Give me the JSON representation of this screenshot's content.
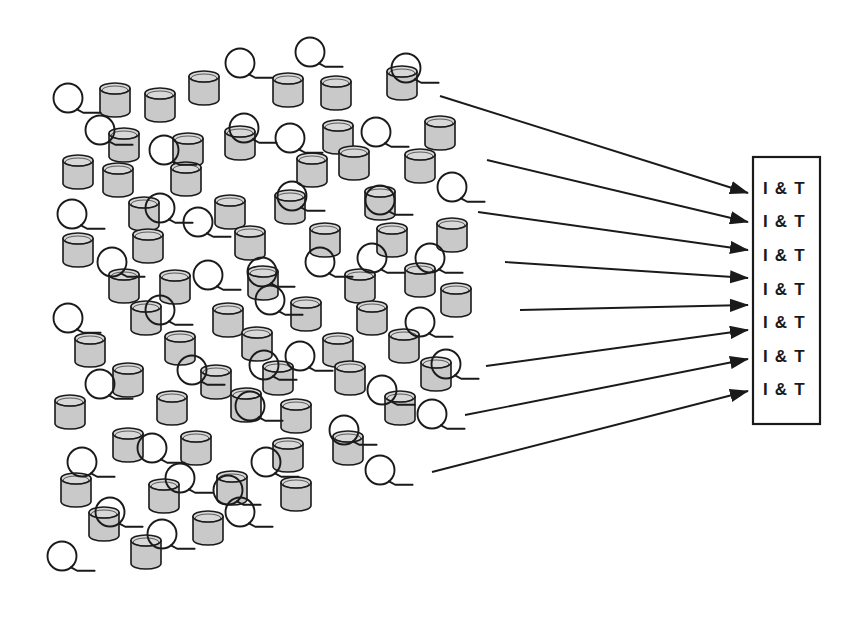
{
  "diagram": {
    "background_color": "#ffffff",
    "stroke_color": "#1a1a1a",
    "cylinder_fill": "#c9c9c9",
    "cylinder_top_fill": "#d8d8d8",
    "loop_icon_name": "coil-loop-symbol",
    "cylinder_icon_name": "cylinder-symbol"
  },
  "target_box": {
    "name": "integration-and-test-box",
    "x": 753,
    "y": 157,
    "width": 67,
    "height": 267,
    "border_color": "#1a1a1a",
    "fill": "#ffffff",
    "rows": [
      {
        "label": "I & T"
      },
      {
        "label": "I & T"
      },
      {
        "label": "I & T"
      },
      {
        "label": "I & T"
      },
      {
        "label": "I & T"
      },
      {
        "label": "I & T"
      },
      {
        "label": "I & T"
      }
    ]
  },
  "arrows": [
    {
      "name": "arrow-1",
      "x1": 440,
      "y1": 96,
      "x2": 748,
      "y2": 193
    },
    {
      "name": "arrow-2",
      "x1": 487,
      "y1": 160,
      "x2": 748,
      "y2": 222
    },
    {
      "name": "arrow-3",
      "x1": 478,
      "y1": 212,
      "x2": 748,
      "y2": 250
    },
    {
      "name": "arrow-4",
      "x1": 505,
      "y1": 262,
      "x2": 748,
      "y2": 278
    },
    {
      "name": "arrow-5",
      "x1": 520,
      "y1": 310,
      "x2": 748,
      "y2": 305
    },
    {
      "name": "arrow-6",
      "x1": 486,
      "y1": 366,
      "x2": 748,
      "y2": 330
    },
    {
      "name": "arrow-7",
      "x1": 465,
      "y1": 415,
      "x2": 748,
      "y2": 359
    },
    {
      "name": "arrow-8",
      "x1": 432,
      "y1": 472,
      "x2": 748,
      "y2": 391
    }
  ],
  "cylinders": [
    {
      "x": 115,
      "y": 100
    },
    {
      "x": 160,
      "y": 105
    },
    {
      "x": 204,
      "y": 88
    },
    {
      "x": 288,
      "y": 90
    },
    {
      "x": 336,
      "y": 93
    },
    {
      "x": 402,
      "y": 83
    },
    {
      "x": 124,
      "y": 145
    },
    {
      "x": 188,
      "y": 150
    },
    {
      "x": 240,
      "y": 143
    },
    {
      "x": 338,
      "y": 137
    },
    {
      "x": 440,
      "y": 133
    },
    {
      "x": 78,
      "y": 172
    },
    {
      "x": 118,
      "y": 180
    },
    {
      "x": 186,
      "y": 179
    },
    {
      "x": 312,
      "y": 170
    },
    {
      "x": 354,
      "y": 163
    },
    {
      "x": 420,
      "y": 166
    },
    {
      "x": 144,
      "y": 214
    },
    {
      "x": 230,
      "y": 212
    },
    {
      "x": 290,
      "y": 207
    },
    {
      "x": 380,
      "y": 203
    },
    {
      "x": 78,
      "y": 250
    },
    {
      "x": 148,
      "y": 246
    },
    {
      "x": 250,
      "y": 243
    },
    {
      "x": 325,
      "y": 240
    },
    {
      "x": 392,
      "y": 240
    },
    {
      "x": 452,
      "y": 235
    },
    {
      "x": 124,
      "y": 286
    },
    {
      "x": 175,
      "y": 287
    },
    {
      "x": 263,
      "y": 283
    },
    {
      "x": 360,
      "y": 286
    },
    {
      "x": 420,
      "y": 280
    },
    {
      "x": 456,
      "y": 300
    },
    {
      "x": 146,
      "y": 318
    },
    {
      "x": 228,
      "y": 320
    },
    {
      "x": 306,
      "y": 314
    },
    {
      "x": 372,
      "y": 318
    },
    {
      "x": 90,
      "y": 350
    },
    {
      "x": 180,
      "y": 348
    },
    {
      "x": 257,
      "y": 344
    },
    {
      "x": 338,
      "y": 350
    },
    {
      "x": 404,
      "y": 346
    },
    {
      "x": 128,
      "y": 380
    },
    {
      "x": 216,
      "y": 382
    },
    {
      "x": 278,
      "y": 378
    },
    {
      "x": 350,
      "y": 378
    },
    {
      "x": 436,
      "y": 374
    },
    {
      "x": 70,
      "y": 412
    },
    {
      "x": 172,
      "y": 408
    },
    {
      "x": 246,
      "y": 405
    },
    {
      "x": 296,
      "y": 416
    },
    {
      "x": 400,
      "y": 408
    },
    {
      "x": 128,
      "y": 445
    },
    {
      "x": 196,
      "y": 448
    },
    {
      "x": 288,
      "y": 455
    },
    {
      "x": 348,
      "y": 448
    },
    {
      "x": 76,
      "y": 490
    },
    {
      "x": 164,
      "y": 496
    },
    {
      "x": 232,
      "y": 488
    },
    {
      "x": 296,
      "y": 494
    },
    {
      "x": 104,
      "y": 524
    },
    {
      "x": 208,
      "y": 528
    },
    {
      "x": 146,
      "y": 552
    }
  ],
  "loops": [
    {
      "x": 68,
      "y": 98
    },
    {
      "x": 240,
      "y": 63
    },
    {
      "x": 310,
      "y": 52
    },
    {
      "x": 406,
      "y": 68
    },
    {
      "x": 100,
      "y": 130
    },
    {
      "x": 164,
      "y": 150
    },
    {
      "x": 244,
      "y": 128
    },
    {
      "x": 290,
      "y": 138
    },
    {
      "x": 376,
      "y": 132
    },
    {
      "x": 452,
      "y": 187
    },
    {
      "x": 72,
      "y": 214
    },
    {
      "x": 160,
      "y": 208
    },
    {
      "x": 198,
      "y": 222
    },
    {
      "x": 292,
      "y": 196
    },
    {
      "x": 380,
      "y": 200
    },
    {
      "x": 112,
      "y": 262
    },
    {
      "x": 208,
      "y": 275
    },
    {
      "x": 262,
      "y": 272
    },
    {
      "x": 320,
      "y": 262
    },
    {
      "x": 430,
      "y": 258
    },
    {
      "x": 68,
      "y": 318
    },
    {
      "x": 160,
      "y": 310
    },
    {
      "x": 270,
      "y": 300
    },
    {
      "x": 372,
      "y": 258
    },
    {
      "x": 420,
      "y": 322
    },
    {
      "x": 100,
      "y": 384
    },
    {
      "x": 192,
      "y": 370
    },
    {
      "x": 264,
      "y": 365
    },
    {
      "x": 300,
      "y": 356
    },
    {
      "x": 382,
      "y": 390
    },
    {
      "x": 250,
      "y": 406
    },
    {
      "x": 446,
      "y": 364
    },
    {
      "x": 82,
      "y": 462
    },
    {
      "x": 152,
      "y": 448
    },
    {
      "x": 180,
      "y": 478
    },
    {
      "x": 228,
      "y": 490
    },
    {
      "x": 266,
      "y": 462
    },
    {
      "x": 344,
      "y": 430
    },
    {
      "x": 380,
      "y": 470
    },
    {
      "x": 432,
      "y": 414
    },
    {
      "x": 110,
      "y": 512
    },
    {
      "x": 162,
      "y": 534
    },
    {
      "x": 62,
      "y": 556
    },
    {
      "x": 240,
      "y": 512
    }
  ]
}
